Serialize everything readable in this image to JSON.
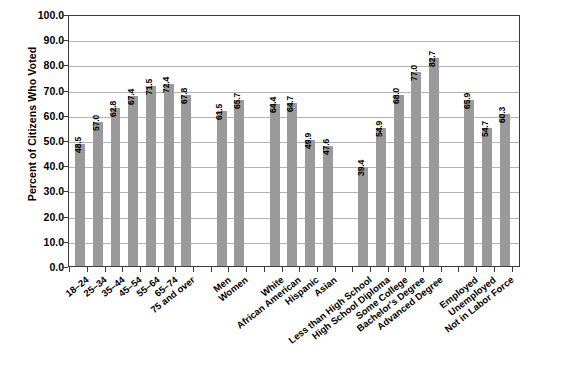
{
  "chart_data": {
    "type": "bar",
    "title": "",
    "xlabel": "",
    "ylabel": "Percent of Citizens Who Voted",
    "ylim": [
      0,
      100
    ],
    "ytick_labels": [
      "100.0",
      "90.0",
      "80.0",
      "70.0",
      "60.0",
      "50.0",
      "40.0",
      "30.0",
      "20.0",
      "10.0",
      "0.0"
    ],
    "ytick_values": [
      100,
      90,
      80,
      70,
      60,
      50,
      40,
      30,
      20,
      10,
      0
    ],
    "grid": true,
    "legend": "none",
    "bar_color": "#9a9a9a",
    "categories": [
      "18–24",
      "25–34",
      "35–44",
      "45–54",
      "55–64",
      "65–74",
      "75 and over",
      "Men",
      "Women",
      "White",
      "African American",
      "Hispanic",
      "Asian",
      "Less than High School",
      "High School Diploma",
      "Some College",
      "Bachelor's Degree",
      "Advanced Degree",
      "Employed",
      "Unemployed",
      "Not in Labor Force"
    ],
    "values": [
      48.5,
      57.0,
      62.8,
      67.4,
      71.5,
      72.4,
      67.8,
      61.5,
      65.7,
      64.4,
      64.7,
      49.9,
      47.6,
      39.4,
      54.9,
      68.0,
      77.0,
      82.7,
      65.9,
      54.7,
      60.3
    ],
    "value_labels": [
      "48.5",
      "57.0",
      "62.8",
      "67.4",
      "71.5",
      "72.4",
      "67.8",
      "61.5",
      "65.7",
      "64.4",
      "64.7",
      "49.9",
      "47.6",
      "39.4",
      "54.9",
      "68.0",
      "77.0",
      "82.7",
      "65.9",
      "54.7",
      "60.3"
    ],
    "groups": [
      {
        "name": "Age",
        "start": 0,
        "count": 7
      },
      {
        "name": "Sex",
        "start": 7,
        "count": 2
      },
      {
        "name": "Race and Hispanic Origin",
        "start": 9,
        "count": 4
      },
      {
        "name": "Educational Attainment",
        "start": 13,
        "count": 5
      },
      {
        "name": "Employment Status",
        "start": 18,
        "count": 3
      }
    ]
  }
}
